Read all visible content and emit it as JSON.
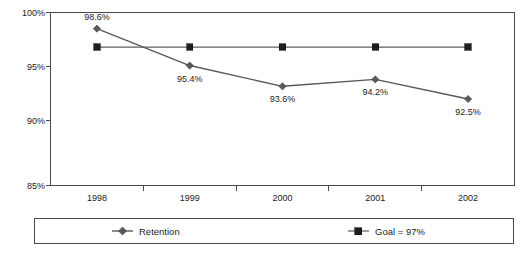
{
  "chart_data": {
    "type": "line",
    "title": "",
    "subtitle": "",
    "xlabel": "",
    "ylabel": "",
    "categories": [
      "1998",
      "1999",
      "2000",
      "2001",
      "2002"
    ],
    "ylim": [
      85,
      100
    ],
    "ytick_values": [
      100,
      95,
      90,
      85
    ],
    "ytick_labels": [
      "100%",
      "95%",
      "90%",
      "85%"
    ],
    "grid": false,
    "legend_position": "bottom",
    "series": [
      {
        "name": "Retention",
        "marker": "diamond",
        "color": "#5a5a5a",
        "values": [
          98.6,
          95.4,
          93.6,
          94.2,
          92.5
        ],
        "data_labels": [
          "98.6%",
          "95.4%",
          "93.6%",
          "94.2%",
          "92.5%"
        ],
        "data_label_positions": [
          "above",
          "below",
          "below",
          "below",
          "below"
        ]
      },
      {
        "name": "Goal = 97%",
        "marker": "square",
        "color": "#1e1e1e",
        "values": [
          97,
          97,
          97,
          97,
          97
        ],
        "data_labels": [
          "",
          "",
          "",
          "",
          ""
        ],
        "data_label_positions": []
      }
    ]
  },
  "legend": {
    "entries": [
      {
        "label": "Retention",
        "marker": "diamond-marker-icon"
      },
      {
        "label": "Goal = 97%",
        "marker": "square-marker-icon"
      }
    ]
  },
  "colors": {
    "axis": "#4a4a4a",
    "retention": "#5a5a5a",
    "goal": "#1e1e1e",
    "text": "#1c1c1c",
    "background": "#ffffff"
  }
}
